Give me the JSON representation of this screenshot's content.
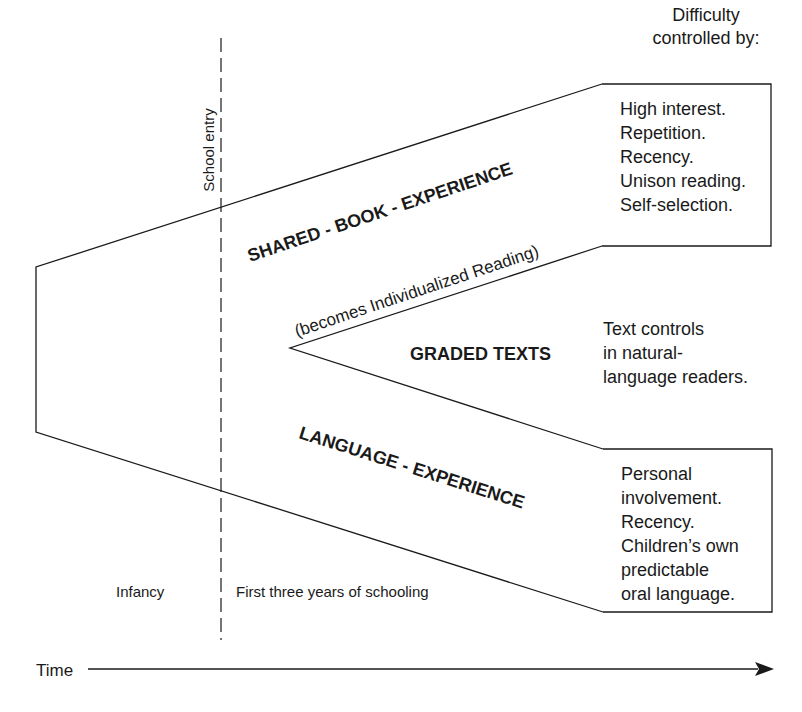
{
  "header": {
    "difficulty_line1": "Difficulty",
    "difficulty_line2": "controlled by:"
  },
  "divider": {
    "label": "School entry"
  },
  "streams": {
    "shared_book": {
      "label": "SHARED - BOOK - EXPERIENCE",
      "sublabel": "(becomes Individualized Reading)",
      "controls": [
        "High interest.",
        "Repetition.",
        "Recency.",
        "Unison reading.",
        "Self-selection."
      ]
    },
    "graded_texts": {
      "label": "GRADED TEXTS",
      "controls": [
        "Text controls",
        "in natural-",
        "language readers."
      ]
    },
    "language_experience": {
      "label": "LANGUAGE - EXPERIENCE",
      "controls": [
        "Personal",
        "involvement.",
        "Recency.",
        "Children’s own",
        "predictable",
        "oral language."
      ]
    }
  },
  "periods": {
    "before": "Infancy",
    "after": "First three years of schooling"
  },
  "axis": {
    "label": "Time"
  },
  "colors": {
    "ink": "#1a1a1a",
    "background": "#ffffff"
  }
}
